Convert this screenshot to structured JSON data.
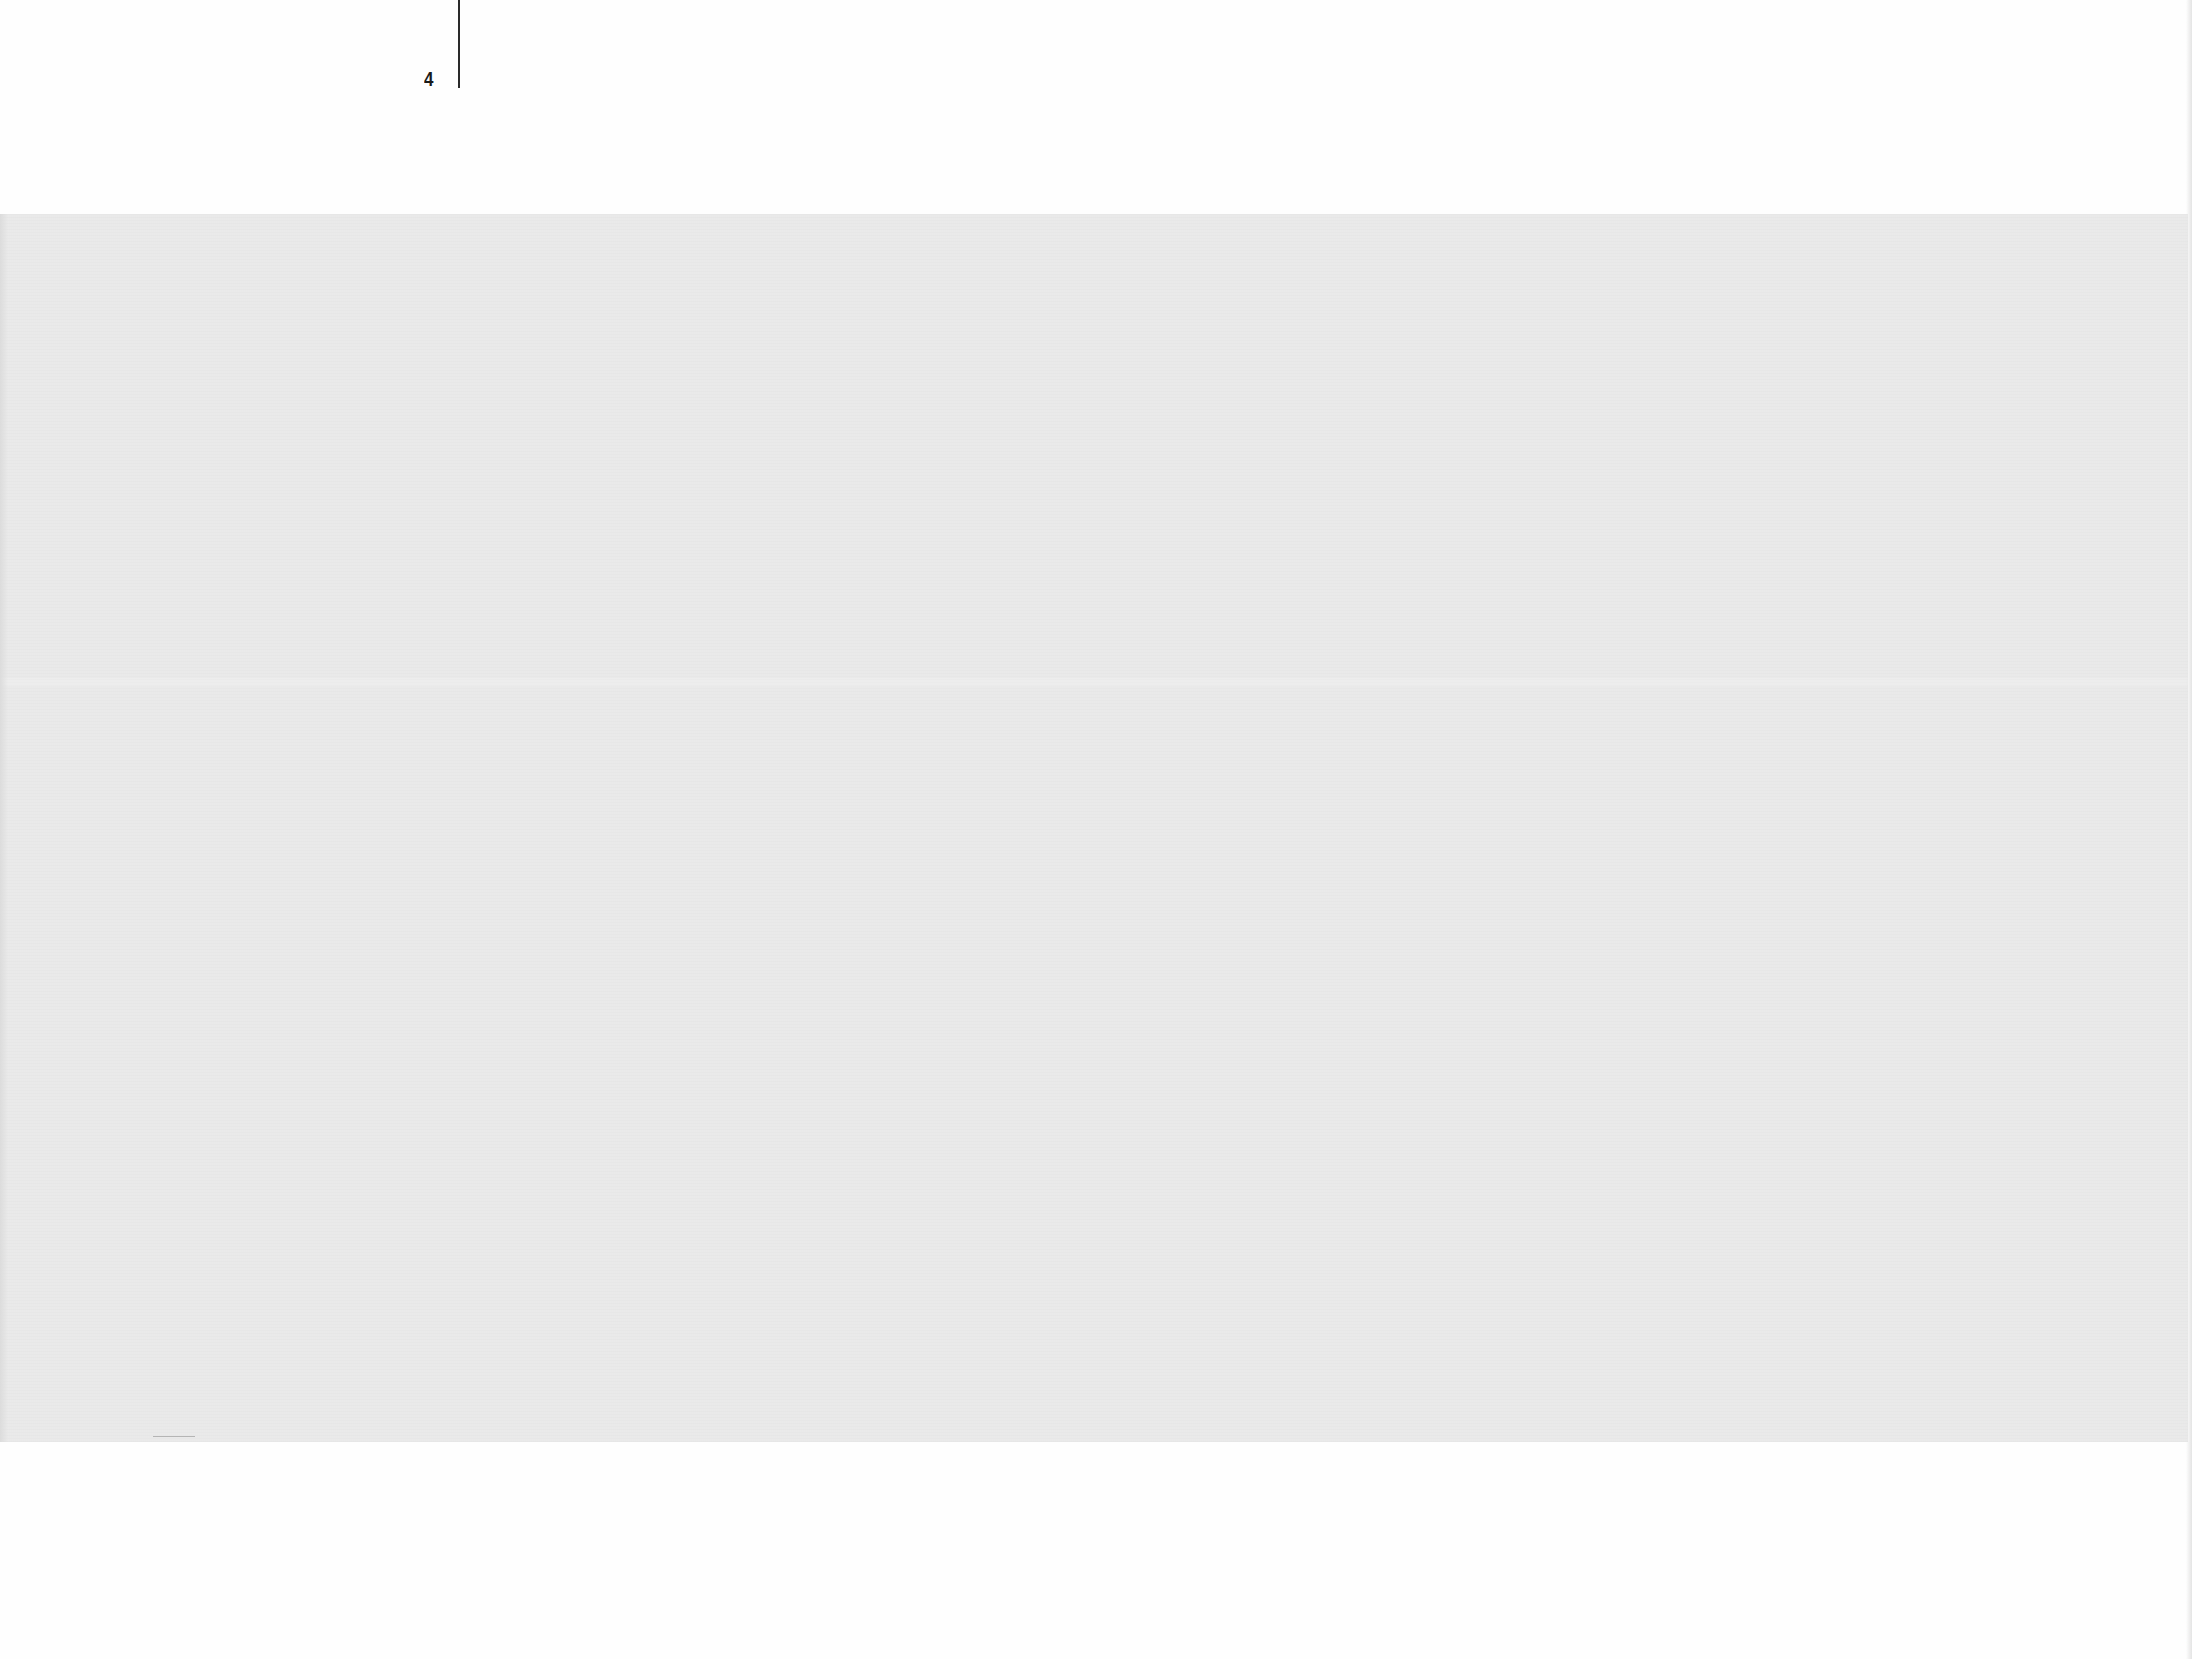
{
  "page": {
    "folio": "4",
    "colors": {
      "paper": "#fefefe",
      "plate": "#e9e9e9",
      "ink": "#1a1a1a"
    }
  },
  "plate": {
    "content": ""
  }
}
